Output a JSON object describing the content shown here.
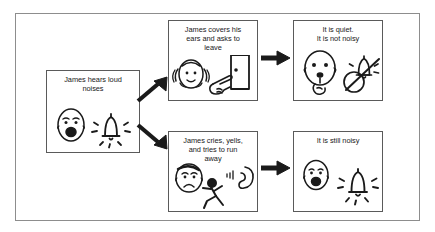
{
  "diagram": {
    "frame_color": "#8d8d8d",
    "line_color": "#1a1a1a",
    "background": "#ffffff"
  },
  "panels": {
    "cause": {
      "id": "cause",
      "text": "James hears loud\nnoises",
      "icons": [
        "distressed-face-icon",
        "ringing-bell-icon"
      ]
    },
    "good_behavior": {
      "id": "good-behavior",
      "text": "James covers his\nears and asks to\nleave",
      "icons": [
        "covering-ears-face-icon",
        "pointing-hand-door-icon"
      ]
    },
    "good_outcome": {
      "id": "good-outcome",
      "text": "It is quiet.\nIt is not noisy",
      "icons": [
        "quiet-shush-face-icon",
        "crossed-out-bell-icon"
      ]
    },
    "bad_behavior": {
      "id": "bad-behavior",
      "text": "James cries, yells,\nand tries to run\naway",
      "icons": [
        "crying-face-icon",
        "ear-hearing-icon",
        "running-stick-figure-icon"
      ]
    },
    "bad_outcome": {
      "id": "bad-outcome",
      "text": "It is still noisy",
      "icons": [
        "distressed-face-icon",
        "ringing-bell-icon"
      ]
    }
  },
  "arrows": {
    "up": {
      "name": "arrow-up-right",
      "direction": "up-right"
    },
    "down": {
      "name": "arrow-down-right",
      "direction": "down-right"
    },
    "right_top": {
      "name": "arrow-right-top",
      "direction": "right"
    },
    "right_bottom": {
      "name": "arrow-right-bottom",
      "direction": "right"
    }
  }
}
